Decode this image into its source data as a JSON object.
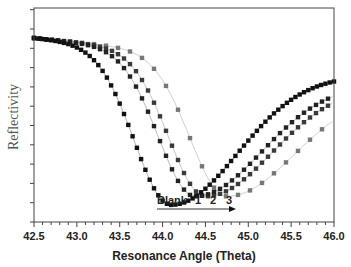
{
  "chart_data": {
    "type": "scatter",
    "title": "",
    "xlabel": "Resonance Angle (Theta)",
    "ylabel": "Reflectivity",
    "xlim": [
      42.5,
      46.0
    ],
    "ylim": [
      0,
      1
    ],
    "x_ticks": [
      "42.5",
      "43.0",
      "43.5",
      "44.0",
      "44.5",
      "45.0",
      "45.5",
      "46.0"
    ],
    "y_tick_labels": [],
    "grid": false,
    "legend": "none (inline annotation)",
    "annotation": {
      "labels": [
        "Blank",
        "1",
        "2",
        "3"
      ],
      "arrow": "right-pointing arrow under labels indicating shift to larger angle"
    },
    "series": [
      {
        "name": "Blank",
        "min_angle": 44.1,
        "min_reflectivity": 0.08,
        "marker": "square",
        "color": "#111111",
        "fit_line_color": "#9a9a9a"
      },
      {
        "name": "1",
        "min_angle": 44.38,
        "min_reflectivity": 0.12,
        "marker": "square",
        "color": "#222222",
        "fit_line_color": "#a8a8a8"
      },
      {
        "name": "2",
        "min_angle": 44.5,
        "min_reflectivity": 0.12,
        "marker": "square",
        "color": "#3a3a3a",
        "fit_line_color": "#b5b5b5"
      },
      {
        "name": "3",
        "min_angle": 44.75,
        "min_reflectivity": 0.12,
        "marker": "square",
        "color": "#777777",
        "fit_line_color": "#c4c4c4"
      }
    ],
    "baseline_reflectivity_at_42.5": 0.86,
    "right_edge_reflectivity": {
      "Blank": 0.63,
      "1": 0.59,
      "2": 0.58,
      "3": 0.55
    }
  },
  "axis": {
    "xlabel": "Resonance Angle (Theta)",
    "ylabel": "Reflectivity",
    "x_ticks": [
      "42.5",
      "43.0",
      "43.5",
      "44.0",
      "44.5",
      "45.0",
      "45.5",
      "46.0"
    ]
  },
  "annotation": {
    "blank": "Blank",
    "one": "1",
    "two": "2",
    "three": "3"
  }
}
